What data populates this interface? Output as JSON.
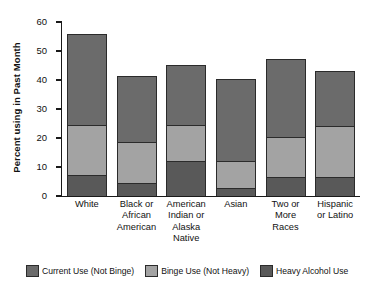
{
  "chart_data": {
    "type": "bar",
    "subtype": "stacked-bar",
    "title": "",
    "xlabel": "",
    "ylabel": "Percent using in Past Month",
    "ylim": [
      0,
      60
    ],
    "yticks": [
      0,
      10,
      20,
      30,
      40,
      50,
      60
    ],
    "ytick_labels": [
      "0",
      "10",
      "20",
      "30",
      "40",
      "50",
      "60"
    ],
    "grid": false,
    "legend_position": "bottom",
    "categories": [
      "White",
      "Black or African American",
      "American Indian or Alaska Native",
      "Asian",
      "Two or More Races",
      "Hispanic or Latino"
    ],
    "category_label_lines": [
      [
        "White"
      ],
      [
        "Black or",
        "African",
        "American"
      ],
      [
        "American",
        "Indian or",
        "Alaska",
        "Native"
      ],
      [
        "Asian"
      ],
      [
        "Two or",
        "More",
        "Races"
      ],
      [
        "Hispanic",
        "or Latino"
      ]
    ],
    "series": [
      {
        "name": "Heavy Alcohol Use",
        "color": "#595959",
        "values": [
          7.2,
          4.5,
          12.1,
          2.8,
          6.6,
          6.6
        ]
      },
      {
        "name": "Binge Use (Not Heavy)",
        "color": "#a3a3a3",
        "values": [
          17.4,
          14.1,
          12.4,
          9.3,
          13.7,
          17.5
        ]
      },
      {
        "name": "Current Use (Not Binge)",
        "color": "#6b6b6b",
        "values": [
          31.4,
          22.7,
          20.6,
          28.2,
          27.0,
          19.0
        ]
      }
    ],
    "totals": [
      56.0,
      41.3,
      45.1,
      40.3,
      47.3,
      43.1
    ],
    "segment_tops": [
      [
        7.2,
        24.6,
        56.0
      ],
      [
        4.5,
        18.6,
        41.3
      ],
      [
        12.1,
        24.5,
        45.1
      ],
      [
        2.8,
        12.1,
        40.3
      ],
      [
        6.6,
        20.3,
        47.3
      ],
      [
        6.6,
        24.1,
        43.1
      ]
    ],
    "legend": [
      {
        "label": "Current Use (Not Binge)",
        "color": "#6b6b6b"
      },
      {
        "label": "Binge Use (Not Heavy)",
        "color": "#a3a3a3"
      },
      {
        "label": "Heavy Alcohol Use",
        "color": "#595959"
      }
    ]
  }
}
